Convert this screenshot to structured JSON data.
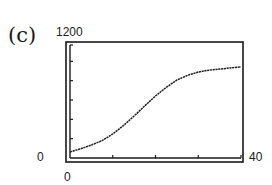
{
  "panel_label": "(c)",
  "axes": {
    "y_max_label": "1200",
    "y_min_label": "0",
    "x_min_label": "0",
    "x_max_label": "40"
  },
  "colors": {
    "line": "#222222",
    "frame": "#1a1a1a",
    "background": "#ffffff"
  },
  "chart_data": {
    "type": "line",
    "title": "(c)",
    "xlabel": "",
    "ylabel": "",
    "xlim": [
      0,
      40
    ],
    "ylim": [
      0,
      1200
    ],
    "x_ticks": [
      0,
      10,
      20,
      30,
      40
    ],
    "y_ticks": [
      0,
      200,
      400,
      600,
      800,
      1000,
      1200
    ],
    "tick_labels_shown": {
      "x": [
        "0",
        "40"
      ],
      "y": [
        "0",
        "1200"
      ]
    },
    "grid": false,
    "legend": null,
    "series": [
      {
        "name": "curve",
        "x": [
          0,
          2.5,
          5,
          7.5,
          10,
          12.5,
          15,
          17.5,
          20,
          22.5,
          25,
          27.5,
          30,
          32.5,
          35,
          37.5,
          40
        ],
        "values": [
          62,
          95,
          134,
          180,
          248,
          335,
          434,
          540,
          641,
          730,
          807,
          855,
          890,
          908,
          920,
          932,
          941
        ]
      }
    ]
  }
}
